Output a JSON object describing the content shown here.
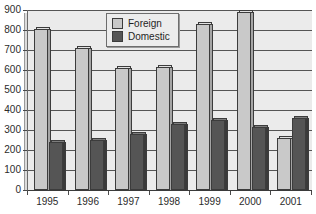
{
  "chart_data": {
    "type": "bar",
    "title": "",
    "xlabel": "",
    "ylabel": "",
    "categories": [
      "1995",
      "1996",
      "1997",
      "1998",
      "1999",
      "2000",
      "2001"
    ],
    "series": [
      {
        "name": "Foreign",
        "color": "#c9c9c9",
        "values": [
          805,
          710,
          610,
          615,
          830,
          888,
          262
        ]
      },
      {
        "name": "Domestic",
        "color": "#555555",
        "values": [
          240,
          248,
          282,
          328,
          350,
          315,
          362
        ]
      }
    ],
    "ylim": [
      0,
      900
    ],
    "ytick_step": 100,
    "yticks": [
      "0",
      "100",
      "200",
      "300",
      "400",
      "500",
      "600",
      "700",
      "800",
      "900"
    ],
    "grid": true,
    "grid_axis": "y",
    "legend_position": "top-center",
    "style": "3d-column",
    "plot_background": "#ebebeb"
  },
  "legend": {
    "items": [
      {
        "label": "Foreign"
      },
      {
        "label": "Domestic"
      }
    ]
  },
  "cropped": {
    "top_text": "",
    "bottom_text": ""
  }
}
